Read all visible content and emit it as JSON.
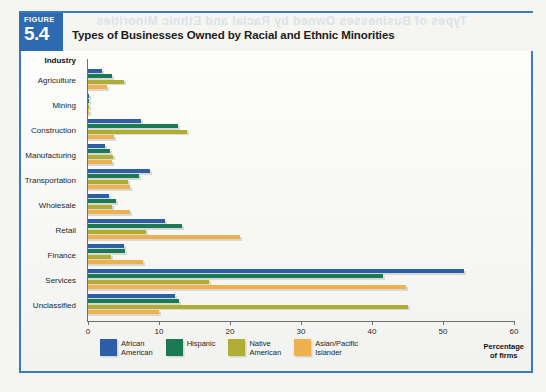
{
  "figure": {
    "badge_word": "FIGURE",
    "badge_number": "5.4",
    "title": "Types of Businesses Owned by Racial and Ethnic Minorities"
  },
  "ghost_text": {
    "reverse_title": "Types of Businesses Owned by Racial and Ethnic Minorities",
    "reverse_heading": "Private Investors"
  },
  "legend": {
    "items": [
      {
        "label": "African\nAmerican",
        "color": "#2c5fa8"
      },
      {
        "label": "Hispanic",
        "color": "#1b7a54"
      },
      {
        "label": "Native\nAmerican",
        "color": "#b0ad34"
      },
      {
        "label": "Asian/Pacific\nIslander",
        "color": "#efb050"
      }
    ]
  },
  "axis": {
    "x_title": "Percentage\nof firms",
    "y_header": "Industry",
    "x_ticks": [
      "0",
      "10",
      "20",
      "30",
      "40",
      "50",
      "60"
    ]
  },
  "chart_data": {
    "type": "bar",
    "orientation": "horizontal",
    "title": "Types of Businesses Owned by Racial and Ethnic Minorities",
    "xlabel": "Percentage of firms",
    "ylabel": "Industry",
    "xlim": [
      0,
      60
    ],
    "xticks": [
      0,
      10,
      20,
      30,
      40,
      50,
      60
    ],
    "grid": false,
    "legend_position": "bottom",
    "categories": [
      "Agriculture",
      "Mining",
      "Construction",
      "Manufacturing",
      "Transportation",
      "Wholesale",
      "Retail",
      "Finance",
      "Services",
      "Unclassified"
    ],
    "series": [
      {
        "name": "African American",
        "color": "#2c5fa8",
        "values": [
          2.0,
          0.1,
          7.4,
          2.4,
          8.7,
          3.0,
          10.8,
          5.0,
          53.0,
          12.2
        ]
      },
      {
        "name": "Hispanic",
        "color": "#1b7a54",
        "values": [
          3.4,
          0.2,
          12.7,
          3.1,
          7.2,
          4.0,
          13.2,
          5.2,
          41.5,
          12.8
        ]
      },
      {
        "name": "Native American",
        "color": "#b0ad34",
        "values": [
          5.0,
          0.2,
          14.0,
          3.5,
          5.6,
          3.4,
          8.2,
          3.2,
          17.0,
          45.0
        ]
      },
      {
        "name": "Asian/Pacific Islander",
        "color": "#efb050",
        "values": [
          2.7,
          0.1,
          3.6,
          3.4,
          5.9,
          5.9,
          21.4,
          7.7,
          44.8,
          10.0
        ]
      }
    ]
  }
}
